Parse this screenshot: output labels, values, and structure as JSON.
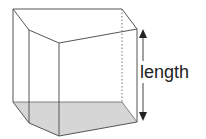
{
  "diagram": {
    "type": "pentagonal-prism",
    "label": "length",
    "colors": {
      "edge": "#555555",
      "base_fill": "#d6d6d6",
      "arrow": "#222222",
      "background": "#ffffff"
    },
    "dimension": {
      "name": "length",
      "orientation": "vertical"
    }
  }
}
